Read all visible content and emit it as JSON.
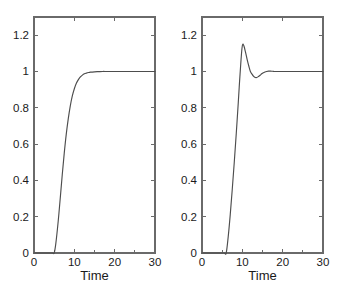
{
  "figure": {
    "title": "",
    "background_color": "#ffffff",
    "axis_color": "#6a6a6a",
    "curve_color": "#4d4d4d",
    "text_color": "#1a1a1a"
  },
  "chart_data": [
    {
      "id": "left",
      "type": "line",
      "title": "",
      "xlabel": "Time",
      "ylabel": "",
      "xlim": [
        0,
        30
      ],
      "ylim": [
        0,
        1.3
      ],
      "grid": false,
      "legend": null,
      "xticks": [
        0,
        10,
        20,
        30
      ],
      "xtick_labels": [
        "0",
        "10",
        "20",
        "30"
      ],
      "xminor_ticks": [
        5,
        15,
        25
      ],
      "yticks": [
        0,
        0.2,
        0.4,
        0.6,
        0.8,
        1,
        1.2
      ],
      "ytick_labels": [
        "0",
        "0.2",
        "0.4",
        "0.6",
        "0.8",
        "1",
        "1.2"
      ],
      "series": [
        {
          "name": "step response (overdamped)",
          "x": [
            0,
            1,
            2,
            3,
            4,
            4.6,
            5,
            5.4,
            6,
            6.5,
            7,
            7.5,
            8,
            8.5,
            9,
            9.5,
            10,
            10.5,
            11,
            11.5,
            12,
            12.5,
            13,
            13.5,
            14,
            15,
            16,
            17,
            18,
            20,
            22,
            25,
            28,
            30
          ],
          "y": [
            0,
            0,
            0,
            0,
            0,
            0,
            0.0,
            0.05,
            0.175,
            0.3,
            0.43,
            0.55,
            0.655,
            0.74,
            0.81,
            0.865,
            0.905,
            0.935,
            0.955,
            0.97,
            0.98,
            0.987,
            0.991,
            0.994,
            0.996,
            0.998,
            0.999,
            1.0,
            1.0,
            1.0,
            1.0,
            1.0,
            1.0,
            1.0
          ]
        }
      ]
    },
    {
      "id": "right",
      "type": "line",
      "title": "",
      "xlabel": "Time",
      "ylabel": "",
      "xlim": [
        0,
        30
      ],
      "ylim": [
        0,
        1.3
      ],
      "grid": false,
      "legend": null,
      "xticks": [
        0,
        10,
        20,
        30
      ],
      "xtick_labels": [
        "0",
        "10",
        "20",
        "30"
      ],
      "xminor_ticks": [
        5,
        15,
        25
      ],
      "yticks": [
        0,
        0.2,
        0.4,
        0.6,
        0.8,
        1,
        1.2
      ],
      "ytick_labels": [
        "0",
        "0.2",
        "0.4",
        "0.6",
        "0.8",
        "1",
        "1.2"
      ],
      "series": [
        {
          "name": "step response (underdamped, overshoot)",
          "x": [
            0,
            2,
            4,
            5.5,
            6,
            6.5,
            7,
            7.5,
            8,
            8.5,
            9,
            9.3,
            9.6,
            9.9,
            10.1,
            10.4,
            10.8,
            11.2,
            11.6,
            12,
            12.4,
            12.8,
            13.2,
            13.6,
            14,
            14.4,
            14.8,
            15.2,
            15.6,
            16,
            16.5,
            17,
            17.5,
            18,
            19,
            20,
            22,
            24,
            26,
            28,
            30
          ],
          "y": [
            0,
            0,
            0,
            0,
            0.0,
            0.09,
            0.21,
            0.35,
            0.5,
            0.66,
            0.83,
            0.94,
            1.04,
            1.125,
            1.15,
            1.14,
            1.105,
            1.065,
            1.03,
            1.0,
            0.985,
            0.973,
            0.967,
            0.967,
            0.972,
            0.979,
            0.987,
            0.993,
            0.997,
            1.0,
            1.002,
            1.002,
            1.001,
            1.0,
            1.0,
            1.0,
            1.0,
            1.0,
            1.0,
            1.0,
            1.0
          ]
        }
      ]
    }
  ],
  "layout": {
    "plot_box": {
      "left_panel": {
        "x": 34,
        "y": 17,
        "width": 121,
        "height": 236
      },
      "right_panel": {
        "x": 33,
        "y": 17,
        "width": 121,
        "height": 236
      }
    },
    "tick_length": 4
  }
}
